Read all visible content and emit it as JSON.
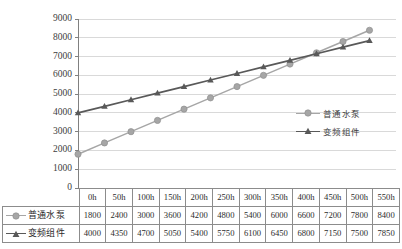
{
  "chart_data": {
    "type": "line",
    "title": "",
    "xlabel": "",
    "ylabel": "",
    "categories": [
      "0h",
      "50h",
      "100h",
      "150h",
      "200h",
      "250h",
      "300h",
      "350h",
      "400h",
      "450h",
      "500h",
      "550h"
    ],
    "series": [
      {
        "name": "普通水泵",
        "color": "#a6a6a6",
        "marker": "circle",
        "values": [
          1800,
          2400,
          3000,
          3600,
          4200,
          4800,
          5400,
          6000,
          6600,
          7200,
          7800,
          8400
        ]
      },
      {
        "name": "变频组件",
        "color": "#595959",
        "marker": "triangle",
        "values": [
          4000,
          4350,
          4700,
          5050,
          5400,
          5750,
          6100,
          6450,
          6800,
          7150,
          7500,
          7850
        ]
      }
    ],
    "ylim": [
      0,
      9000
    ],
    "yticks": [
      0,
      1000,
      2000,
      3000,
      4000,
      5000,
      6000,
      7000,
      8000,
      9000
    ],
    "ytick_labels": [
      "0",
      "1000",
      "2000",
      "3000",
      "4000",
      "5000",
      "6000",
      "7000",
      "8000",
      "9000"
    ],
    "grid": true,
    "grid_color": "#d9d9d9",
    "axis_color": "#808080",
    "legend_position": "right-middle",
    "has_data_table": true
  },
  "legend": {
    "items": [
      {
        "label": "普通水泵"
      },
      {
        "label": "变频组件"
      }
    ]
  },
  "table": {
    "corner": "",
    "header": [
      "0h",
      "50h",
      "100h",
      "150h",
      "200h",
      "250h",
      "300h",
      "350h",
      "400h",
      "450h",
      "500h",
      "550h"
    ],
    "rows": [
      {
        "name": "普通水泵",
        "cells": [
          "1800",
          "2400",
          "3000",
          "3600",
          "4200",
          "4800",
          "5400",
          "6000",
          "6600",
          "7200",
          "7800",
          "8400"
        ]
      },
      {
        "name": "变频组件",
        "cells": [
          "4000",
          "4350",
          "4700",
          "5050",
          "5400",
          "5750",
          "6100",
          "6450",
          "6800",
          "7150",
          "7500",
          "7850"
        ]
      }
    ]
  }
}
